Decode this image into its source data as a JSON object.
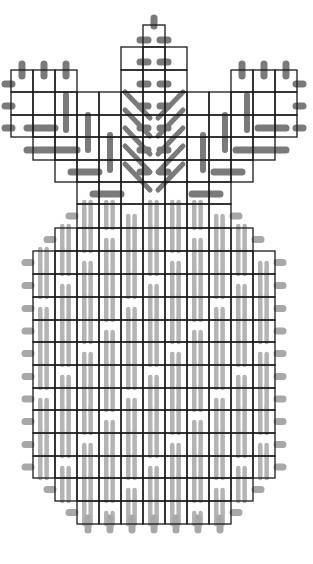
{
  "diagram": {
    "type": "stitch-pattern-chart",
    "width": 313,
    "height": 564,
    "cell": 22.5,
    "colors": {
      "background": "#ffffff",
      "grid": "#1a1a1a",
      "leaf_stitch": "#7a7a7a",
      "body_stitch": "#b4b4b4",
      "outline_stitch": "#a8a8a8"
    },
    "leaves": {
      "center_rows": [
        {
          "y0": 25,
          "y1": 47,
          "x0": 143,
          "x1": 165
        },
        {
          "y0": 47,
          "y1": 70,
          "x0": 121,
          "x1": 187
        },
        {
          "y0": 70,
          "y1": 92,
          "x0": 121,
          "x1": 187
        }
      ],
      "side_rows": [
        {
          "y0": 70,
          "y1": 92,
          "x0": 11,
          "x1": 77
        },
        {
          "y0": 70,
          "y1": 92,
          "x0": 231,
          "x1": 297
        },
        {
          "y0": 92,
          "y1": 115,
          "x0": 11,
          "x1": 297
        },
        {
          "y0": 115,
          "y1": 137,
          "x0": 11,
          "x1": 297
        },
        {
          "y0": 137,
          "y1": 160,
          "x0": 33,
          "x1": 275
        },
        {
          "y0": 160,
          "y1": 182,
          "x0": 55,
          "x1": 253
        },
        {
          "y0": 182,
          "y1": 204,
          "x0": 77,
          "x1": 231
        }
      ]
    },
    "body": {
      "rows": [
        {
          "y0": 204,
          "y1": 228,
          "x0": 77,
          "x1": 231
        },
        {
          "y0": 228,
          "y1": 251,
          "x0": 55,
          "x1": 253
        },
        {
          "y0": 251,
          "y1": 274,
          "x0": 33,
          "x1": 275
        },
        {
          "y0": 274,
          "y1": 297,
          "x0": 33,
          "x1": 275
        },
        {
          "y0": 297,
          "y1": 320,
          "x0": 33,
          "x1": 275
        },
        {
          "y0": 320,
          "y1": 342,
          "x0": 33,
          "x1": 275
        },
        {
          "y0": 342,
          "y1": 365,
          "x0": 33,
          "x1": 275
        },
        {
          "y0": 365,
          "y1": 388,
          "x0": 33,
          "x1": 275
        },
        {
          "y0": 388,
          "y1": 410,
          "x0": 33,
          "x1": 275
        },
        {
          "y0": 410,
          "y1": 433,
          "x0": 33,
          "x1": 275
        },
        {
          "y0": 433,
          "y1": 456,
          "x0": 33,
          "x1": 275
        },
        {
          "y0": 456,
          "y1": 478,
          "x0": 33,
          "x1": 275
        },
        {
          "y0": 478,
          "y1": 501,
          "x0": 55,
          "x1": 253
        },
        {
          "y0": 501,
          "y1": 524,
          "x0": 77,
          "x1": 231
        }
      ]
    }
  }
}
